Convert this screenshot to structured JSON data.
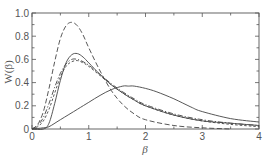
{
  "chart_data": {
    "type": "line",
    "title": "",
    "xlabel": "β",
    "ylabel": "W(β)",
    "xlim": [
      0,
      4
    ],
    "ylim": [
      0,
      1.0
    ],
    "grid": false,
    "legend": "none",
    "x_ticks": [
      "0",
      "1",
      "2",
      "3",
      "4"
    ],
    "y_ticks": [
      "0",
      "0.2",
      "0.4",
      "0.6",
      "0.8",
      "1.0"
    ],
    "series": [
      {
        "name": "long-dashed (tallest)",
        "style": "dashed",
        "x": [
          0,
          0.1,
          0.2,
          0.3,
          0.4,
          0.5,
          0.6,
          0.7,
          0.8,
          0.9,
          1.0,
          1.2,
          1.4,
          1.6,
          1.8,
          2.0,
          2.5,
          3.0,
          3.5
        ],
        "y": [
          0,
          0.04,
          0.15,
          0.35,
          0.58,
          0.78,
          0.89,
          0.92,
          0.89,
          0.81,
          0.7,
          0.5,
          0.33,
          0.21,
          0.13,
          0.08,
          0.03,
          0.01,
          0.0
        ]
      },
      {
        "name": "solid (narrow)",
        "style": "solid",
        "x": [
          0,
          0.2,
          0.3,
          0.4,
          0.5,
          0.6,
          0.7,
          0.8,
          0.9,
          1.0,
          1.2,
          1.4,
          1.6,
          1.8,
          2.0,
          2.5,
          3.0,
          3.5,
          4.0
        ],
        "y": [
          0,
          0.0,
          0.05,
          0.22,
          0.42,
          0.57,
          0.64,
          0.65,
          0.62,
          0.57,
          0.47,
          0.38,
          0.31,
          0.25,
          0.2,
          0.12,
          0.07,
          0.05,
          0.03
        ]
      },
      {
        "name": "dash-dot",
        "style": "dashdot",
        "x": [
          0,
          0.1,
          0.2,
          0.3,
          0.4,
          0.5,
          0.6,
          0.7,
          0.8,
          0.9,
          1.0,
          1.2,
          1.4,
          1.6,
          1.8,
          2.0,
          2.5,
          3.0,
          3.5,
          4.0
        ],
        "y": [
          0,
          0.03,
          0.1,
          0.22,
          0.36,
          0.48,
          0.56,
          0.6,
          0.6,
          0.58,
          0.55,
          0.47,
          0.39,
          0.32,
          0.26,
          0.21,
          0.13,
          0.08,
          0.05,
          0.03
        ]
      },
      {
        "name": "short-dashed",
        "style": "shortdash",
        "x": [
          0,
          0.1,
          0.2,
          0.3,
          0.4,
          0.5,
          0.6,
          0.7,
          0.8,
          0.9,
          1.0,
          1.2,
          1.4,
          1.6,
          1.8,
          2.0,
          2.5,
          3.0,
          3.5,
          4.0
        ],
        "y": [
          0,
          0.02,
          0.07,
          0.17,
          0.31,
          0.45,
          0.54,
          0.58,
          0.59,
          0.57,
          0.54,
          0.46,
          0.38,
          0.31,
          0.25,
          0.2,
          0.12,
          0.07,
          0.04,
          0.02
        ]
      },
      {
        "name": "solid (broad)",
        "style": "solid",
        "x": [
          0,
          0.2,
          0.3,
          0.5,
          0.8,
          1.0,
          1.2,
          1.4,
          1.6,
          1.7,
          1.8,
          2.0,
          2.2,
          2.5,
          2.8,
          3.0,
          3.5,
          4.0
        ],
        "y": [
          0,
          0.01,
          0.02,
          0.08,
          0.17,
          0.23,
          0.29,
          0.34,
          0.37,
          0.37,
          0.37,
          0.35,
          0.32,
          0.26,
          0.19,
          0.15,
          0.09,
          0.06
        ]
      }
    ]
  }
}
